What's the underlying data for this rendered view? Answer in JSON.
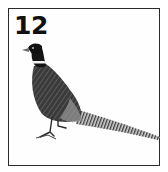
{
  "card": {
    "number": "12",
    "subject": "pheasant",
    "border_color": "#2a2a2a",
    "ink_color": "#1a1a1a"
  }
}
